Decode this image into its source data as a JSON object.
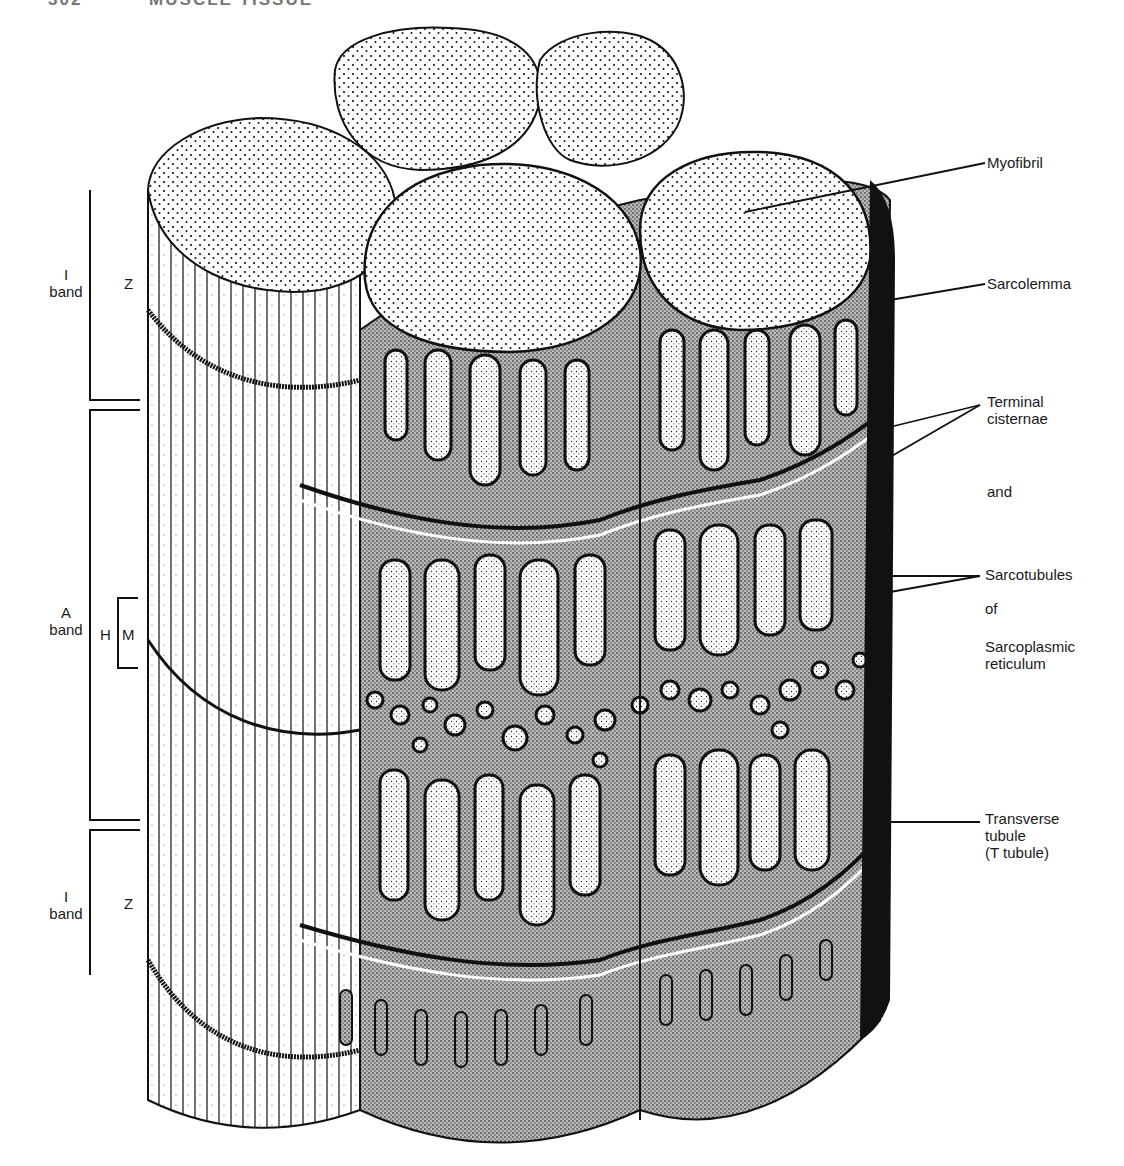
{
  "header": {
    "page_number": "302",
    "running_title": "MUSCLE TISSUE"
  },
  "figure": {
    "left_labels": {
      "i_band_top": {
        "line1": "I",
        "line2": "band"
      },
      "z_top": "Z",
      "a_band": {
        "line1": "A",
        "line2": "band"
      },
      "h": "H",
      "m": "M",
      "i_band_bottom": {
        "line1": "I",
        "line2": "band"
      },
      "z_bottom": "Z"
    },
    "right_labels": {
      "myofibril": "Myofibril",
      "sarcolemma": "Sarcolemma",
      "terminal_cisternae": {
        "line1": "Terminal",
        "line2": "cisternae"
      },
      "and": "and",
      "sarcotubules": "Sarcotubules",
      "of": "of",
      "sarcoplasmic_reticulum": {
        "line1": "Sarcoplasmic",
        "line2": "reticulum"
      },
      "transverse_tubule": {
        "line1": "Transverse",
        "line2": "tubule",
        "line3": "(T tubule)"
      }
    },
    "artist_signature": "wo",
    "colors": {
      "ink": "#111111",
      "reticulum_gray": "#a8a8a8",
      "paper": "#ffffff"
    }
  }
}
